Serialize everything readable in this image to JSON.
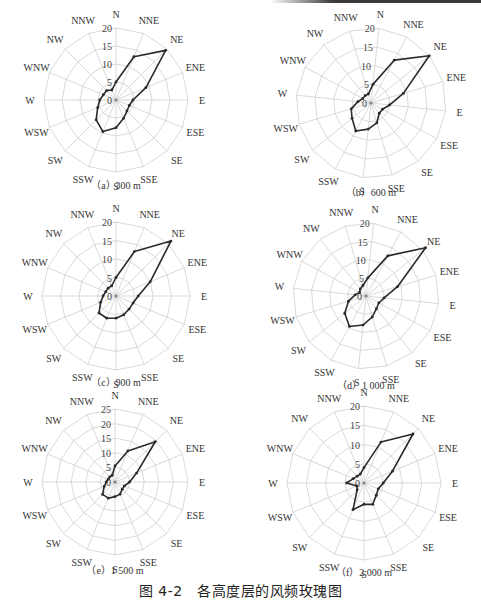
{
  "figure": {
    "caption": "图 4-2　各高度层的风频玫瑰图"
  },
  "directions": [
    "N",
    "NNE",
    "NE",
    "ENE",
    "E",
    "ESE",
    "SE",
    "SSE",
    "S",
    "SSW",
    "SW",
    "WSW",
    "W",
    "WNW",
    "NW",
    "NNW"
  ],
  "chart_data": [
    {
      "type": "radar",
      "id": "a",
      "title": "（a）300 m",
      "categories": [
        "N",
        "NNE",
        "NE",
        "ENE",
        "E",
        "ESE",
        "SE",
        "SSE",
        "S",
        "SSW",
        "SW",
        "WSW",
        "W",
        "WNW",
        "NW",
        "NNW"
      ],
      "rings": [
        0,
        5,
        10,
        15,
        20
      ],
      "rmax": 20,
      "rotation_deg": 0,
      "series": [
        {
          "name": "300 m",
          "values": [
            5,
            13,
            19.5,
            9,
            4.7,
            4,
            4.3,
            5.5,
            7.7,
            9.5,
            7.8,
            5.5,
            4.5,
            3.8,
            3.7,
            3
          ]
        }
      ]
    },
    {
      "type": "radar",
      "id": "b",
      "title": "（b）600 m",
      "categories": [
        "N",
        "NNE",
        "NE",
        "ENE",
        "E",
        "ESE",
        "SE",
        "SSE",
        "S",
        "SSW",
        "SW",
        "WSW",
        "W",
        "WNW",
        "NW",
        "NNW"
      ],
      "rings": [
        0,
        5,
        10,
        15,
        20
      ],
      "rmax": 20,
      "rotation_deg": 6,
      "series": [
        {
          "name": "600 m",
          "values": [
            5,
            13,
            20,
            9,
            5,
            3.5,
            3.5,
            5.5,
            7,
            8.5,
            6.5,
            5.5,
            3.5,
            2.5,
            2.5,
            2.5
          ]
        }
      ]
    },
    {
      "type": "radar",
      "id": "c",
      "title": "（c）900 m",
      "categories": [
        "N",
        "NNE",
        "NE",
        "ENE",
        "E",
        "ESE",
        "SE",
        "SSE",
        "S",
        "SSW",
        "SW",
        "WSW",
        "W",
        "WNW",
        "NW",
        "NNW"
      ],
      "rings": [
        0,
        5,
        10,
        15,
        20
      ],
      "rmax": 20,
      "rotation_deg": 0,
      "series": [
        {
          "name": "900 m",
          "values": [
            5,
            13,
            21,
            10,
            6,
            5,
            5,
            5.5,
            6,
            6.5,
            6.5,
            4.5,
            3.5,
            3,
            3,
            3
          ]
        }
      ]
    },
    {
      "type": "radar",
      "id": "d",
      "title": "（d）1 000 m",
      "categories": [
        "N",
        "NNE",
        "NE",
        "ENE",
        "E",
        "ESE",
        "SE",
        "SSE",
        "S",
        "SSW",
        "SW",
        "WSW",
        "W",
        "WNW",
        "NW",
        "NNW"
      ],
      "rings": [
        0,
        5,
        10,
        15,
        20
      ],
      "rmax": 20,
      "rotation_deg": 6,
      "series": [
        {
          "name": "1 000 m",
          "values": [
            5,
            12.5,
            21,
            9,
            5,
            4,
            4.5,
            6,
            8,
            9.5,
            7.5,
            5,
            3,
            2,
            2.5,
            3
          ]
        }
      ]
    },
    {
      "type": "radar",
      "id": "e",
      "title": "（e）1 500 m",
      "categories": [
        "N",
        "NNE",
        "NE",
        "ENE",
        "E",
        "ESE",
        "SE",
        "SSE",
        "S",
        "SSW",
        "SW",
        "WSW",
        "W",
        "WNW",
        "NW",
        "NNW"
      ],
      "rings": [
        0,
        5,
        10,
        15,
        20,
        25
      ],
      "rmax": 25,
      "rotation_deg": 0,
      "series": [
        {
          "name": "1 500 m",
          "values": [
            5.5,
            11.5,
            19.5,
            8,
            5,
            3.5,
            3.5,
            4.5,
            5,
            6,
            6,
            4,
            3,
            2.5,
            2.5,
            2.5
          ]
        }
      ]
    },
    {
      "type": "radar",
      "id": "f",
      "title": "（f）2 000 m",
      "categories": [
        "N",
        "NNE",
        "NE",
        "ENE",
        "E",
        "ESE",
        "SE",
        "SSE",
        "S",
        "SSW",
        "SW",
        "WSW",
        "W",
        "WNW",
        "NW",
        "NNW"
      ],
      "rings": [
        0,
        5,
        10,
        15,
        20
      ],
      "rmax": 20,
      "rotation_deg": 0,
      "series": [
        {
          "name": "2 000 m",
          "values": [
            4,
            11.5,
            18,
            8,
            5,
            4,
            4.5,
            6,
            5.5,
            7.5,
            2.5,
            2,
            4.5,
            3,
            2.5,
            2.5
          ]
        }
      ]
    }
  ],
  "layout": {
    "panels": [
      {
        "id": "a",
        "cx": 116,
        "cy": 100,
        "r": 72,
        "caption_y": 183
      },
      {
        "id": "b",
        "cx": 371,
        "cy": 103,
        "r": 75,
        "caption_y": 190
      },
      {
        "id": "c",
        "cx": 116,
        "cy": 296,
        "r": 74,
        "caption_y": 380
      },
      {
        "id": "d",
        "cx": 366,
        "cy": 296,
        "r": 73,
        "caption_y": 383
      },
      {
        "id": "e",
        "cx": 115,
        "cy": 482,
        "r": 73,
        "caption_y": 568
      },
      {
        "id": "f",
        "cx": 364,
        "cy": 483,
        "r": 77,
        "caption_y": 570
      }
    ],
    "line_color": "#2a2a2a",
    "grid_color": "#cfcfcf"
  }
}
